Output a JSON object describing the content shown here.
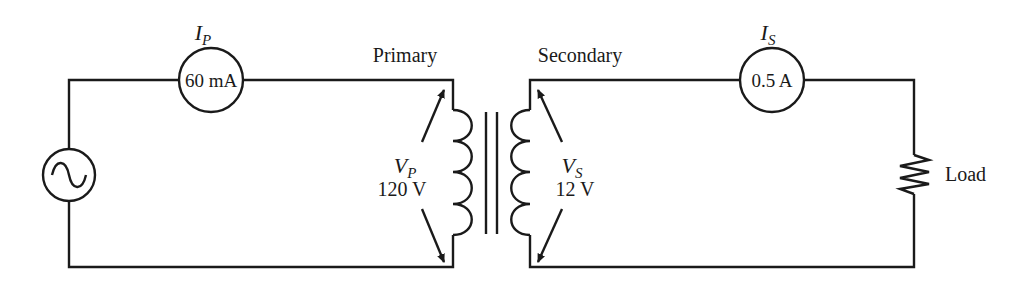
{
  "diagram": {
    "type": "transformer-circuit",
    "source": {
      "symbol": "ac-source"
    },
    "primary": {
      "label": "Primary",
      "current_symbol": "I",
      "current_subscript": "P",
      "current_value": "60 mA",
      "voltage_symbol": "V",
      "voltage_subscript": "P",
      "voltage_value": "120 V"
    },
    "secondary": {
      "label": "Secondary",
      "current_symbol": "I",
      "current_subscript": "S",
      "current_value": "0.5 A",
      "voltage_symbol": "V",
      "voltage_subscript": "S",
      "voltage_value": "12 V"
    },
    "load": {
      "label": "Load"
    },
    "colors": {
      "ink": "#1a1a1a",
      "background": "#ffffff"
    }
  }
}
